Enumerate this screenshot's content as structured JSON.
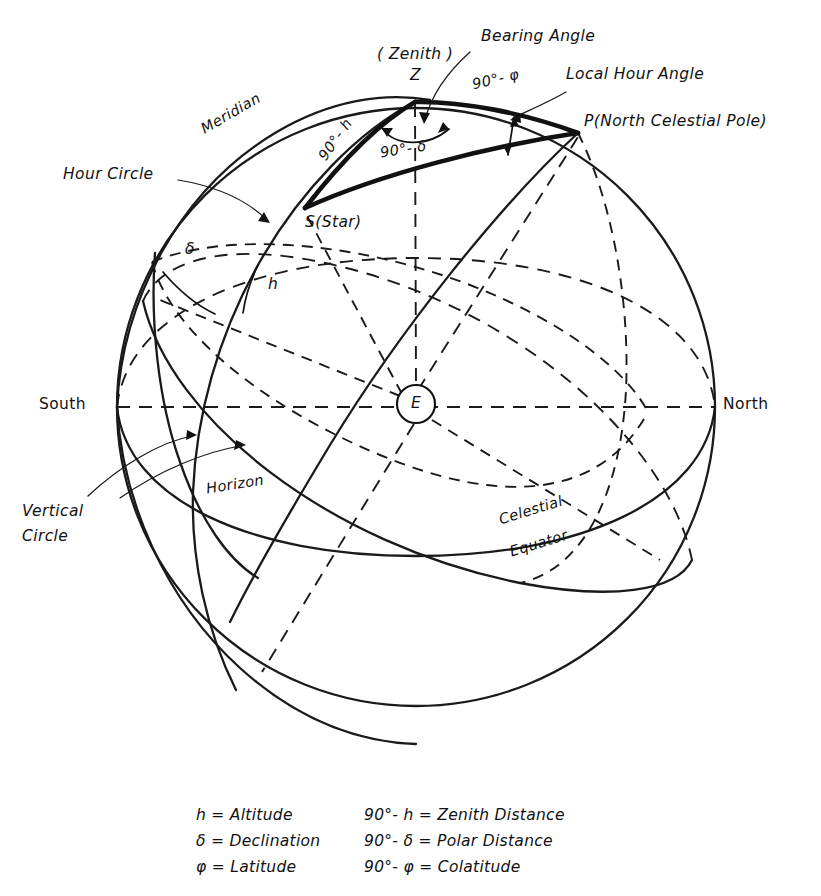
{
  "diagram": {
    "points": {
      "zenith_symbol": "Z",
      "zenith_note": "( Zenith )",
      "star": "S(Star)",
      "pole": "P(North Celestial Pole)",
      "earth": "E"
    },
    "arcs": {
      "zenith_distance": "90°- h",
      "polar_distance": "90°- δ",
      "colatitude": "90°- φ"
    },
    "angles": {
      "bearing": "Bearing Angle",
      "local_hour": "Local Hour Angle"
    },
    "circles": {
      "meridian": "Meridian",
      "hour_circle": "Hour Circle",
      "vertical_circle_line1": "Vertical",
      "vertical_circle_line2": "Circle",
      "horizon": "Horizon",
      "celestial_equator_line1": "Celestial",
      "celestial_equator_line2": "Equator"
    },
    "cardinal": {
      "south": "South",
      "north": "North"
    },
    "measures": {
      "declination": "δ",
      "altitude": "h"
    },
    "colors": {
      "ink": "#111111",
      "background": "#ffffff"
    }
  },
  "legend": {
    "rows": [
      {
        "left": "h = Altitude",
        "right": "90°- h = Zenith Distance"
      },
      {
        "left": "δ = Declination",
        "right": "90°- δ = Polar Distance"
      },
      {
        "left": "φ = Latitude",
        "right": "90°- φ = Colatitude"
      }
    ]
  }
}
